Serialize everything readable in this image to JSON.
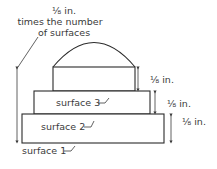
{
  "diagram": {
    "top_note": {
      "line1": "⅛ in.",
      "line2": "times the number",
      "line3": "of surfaces"
    },
    "surfaces": [
      {
        "label": "surface 1"
      },
      {
        "label": "surface 2"
      },
      {
        "label": "surface 3"
      }
    ],
    "dimensions": [
      {
        "label": "⅛ in."
      },
      {
        "label": "⅛ in."
      },
      {
        "label": "⅛ in."
      }
    ]
  }
}
